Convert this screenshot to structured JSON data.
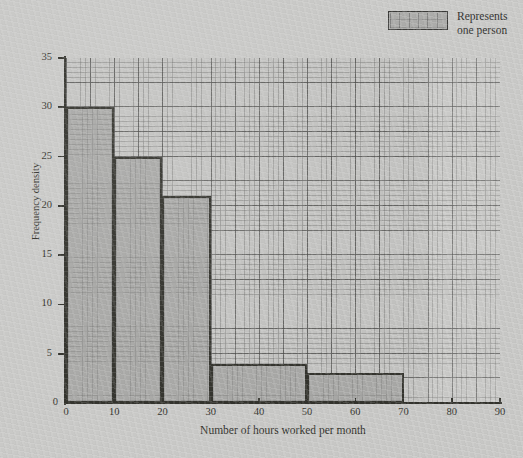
{
  "legend": {
    "swatch_name": "one-person-swatch",
    "line1": "Represents",
    "line2": "one person"
  },
  "axes": {
    "x_label": "Number of hours worked per month",
    "y_label": "Frequency density",
    "x_ticks": [
      "0",
      "10",
      "20",
      "30",
      "40",
      "50",
      "60",
      "70",
      "80",
      "90"
    ],
    "y_ticks": [
      "0",
      "5",
      "10",
      "15",
      "20",
      "25",
      "30",
      "35"
    ],
    "y_origin_label": "0"
  },
  "colors": {
    "page_background": "#c9c9c7",
    "plot_background": "#c4c4c2",
    "bar_fill": "#a9a9a7",
    "bar_outline": "#35352f",
    "axis": "#33332d",
    "grid_minor": "#78786f",
    "grid_major": "#4e4e4c",
    "text": "#2f2f2d"
  },
  "chart_data": {
    "type": "bar",
    "title": "",
    "subtitle": "",
    "xlabel": "Number of hours worked per month",
    "ylabel": "Frequency density",
    "xlim": [
      0,
      90
    ],
    "ylim": [
      0,
      35
    ],
    "x_tick_step": 10,
    "y_tick_step": 5,
    "grid": true,
    "legend_position": "top-right",
    "legend_entries": [
      "Represents one person"
    ],
    "bins": [
      {
        "label": "0-10",
        "x_start": 0,
        "x_end": 10,
        "frequency_density": 30,
        "frequency": 300
      },
      {
        "label": "10-20",
        "x_start": 10,
        "x_end": 20,
        "frequency_density": 25,
        "frequency": 250
      },
      {
        "label": "20-30",
        "x_start": 20,
        "x_end": 30,
        "frequency_density": 21,
        "frequency": 210
      },
      {
        "label": "30-50",
        "x_start": 30,
        "x_end": 50,
        "frequency_density": 4,
        "frequency": 80
      },
      {
        "label": "50-70",
        "x_start": 50,
        "x_end": 70,
        "frequency_density": 3,
        "frequency": 60
      }
    ],
    "categories": [
      "0-10",
      "10-20",
      "20-30",
      "30-50",
      "50-70"
    ],
    "values": [
      30,
      25,
      21,
      4,
      3
    ]
  }
}
